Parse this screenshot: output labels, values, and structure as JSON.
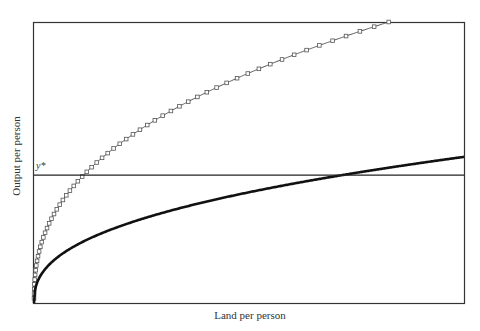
{
  "chart_data": {
    "type": "line",
    "title": "",
    "xlabel": "Land per person",
    "ylabel": "Output per person",
    "xlim": [
      0,
      1
    ],
    "ylim": [
      0,
      1
    ],
    "grid": false,
    "legend": "none",
    "annotations": [
      {
        "text": "y*",
        "y": 0.455,
        "kind": "horizontal-line"
      }
    ],
    "series": [
      {
        "name": "high-productivity production function",
        "style": "thin-line-square-markers",
        "exponent": 0.4,
        "scale": 1.08,
        "color": "#555555"
      },
      {
        "name": "low-productivity production function",
        "style": "thick-line",
        "exponent": 0.4,
        "scale": 0.52,
        "color": "#111111"
      },
      {
        "name": "subsistence output y*",
        "style": "horizontal-line",
        "value": 0.455,
        "color": "#222222"
      }
    ]
  },
  "labels": {
    "x_axis": "Land per person",
    "y_axis": "Output per person",
    "ystar": "y*"
  }
}
